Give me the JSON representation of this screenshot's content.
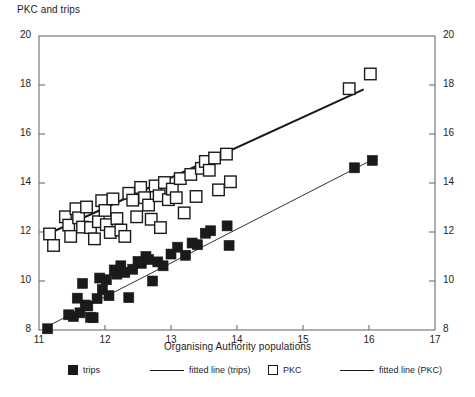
{
  "chart_data": {
    "type": "scatter",
    "title": "PKC and trips",
    "xlabel": "Organising Authority populations",
    "ylabel": "",
    "xlim": [
      11,
      17
    ],
    "ylim": [
      8,
      20
    ],
    "xticks": [
      11,
      12,
      13,
      14,
      15,
      16,
      17
    ],
    "yticks": [
      8,
      10,
      12,
      14,
      16,
      18,
      20
    ],
    "yticks_right": [
      8,
      10,
      12,
      14,
      16,
      18,
      20
    ],
    "grid": false,
    "legend_position": "bottom",
    "series": [
      {
        "name": "trips",
        "marker": "filled-square",
        "color": "#1a1a1a",
        "points": [
          [
            11.13,
            8.05
          ],
          [
            11.45,
            8.62
          ],
          [
            11.52,
            8.55
          ],
          [
            11.58,
            9.3
          ],
          [
            11.62,
            8.7
          ],
          [
            11.66,
            9.9
          ],
          [
            11.7,
            9.02
          ],
          [
            11.74,
            8.98
          ],
          [
            11.78,
            8.52
          ],
          [
            11.82,
            8.5
          ],
          [
            11.88,
            9.28
          ],
          [
            11.92,
            10.12
          ],
          [
            11.96,
            9.65
          ],
          [
            12.02,
            10.05
          ],
          [
            12.06,
            9.4
          ],
          [
            12.14,
            10.45
          ],
          [
            12.18,
            10.28
          ],
          [
            12.24,
            10.62
          ],
          [
            12.3,
            10.35
          ],
          [
            12.36,
            9.32
          ],
          [
            12.42,
            10.48
          ],
          [
            12.5,
            10.8
          ],
          [
            12.55,
            10.72
          ],
          [
            12.62,
            11.0
          ],
          [
            12.66,
            10.88
          ],
          [
            12.72,
            10.0
          ],
          [
            12.8,
            10.78
          ],
          [
            12.88,
            10.62
          ],
          [
            13.0,
            11.1
          ],
          [
            13.1,
            11.38
          ],
          [
            13.22,
            11.05
          ],
          [
            13.32,
            11.55
          ],
          [
            13.4,
            11.48
          ],
          [
            13.52,
            11.95
          ],
          [
            13.6,
            12.05
          ],
          [
            13.85,
            12.25
          ],
          [
            13.88,
            11.45
          ],
          [
            15.78,
            14.62
          ],
          [
            16.05,
            14.92
          ]
        ],
        "fitted_line": {
          "name": "fitted line (trips)",
          "x": [
            11.13,
            16.05
          ],
          "y": [
            8.15,
            14.95
          ],
          "width": 0.9
        }
      },
      {
        "name": "PKC",
        "marker": "open-square",
        "color": "#1a1a1a",
        "points": [
          [
            11.16,
            11.92
          ],
          [
            11.22,
            11.45
          ],
          [
            11.4,
            12.62
          ],
          [
            11.45,
            12.28
          ],
          [
            11.48,
            11.82
          ],
          [
            11.56,
            12.95
          ],
          [
            11.6,
            12.58
          ],
          [
            11.66,
            12.2
          ],
          [
            11.72,
            13.02
          ],
          [
            11.78,
            12.18
          ],
          [
            11.84,
            11.72
          ],
          [
            11.9,
            12.42
          ],
          [
            11.95,
            13.28
          ],
          [
            12.0,
            12.88
          ],
          [
            12.02,
            12.3
          ],
          [
            12.08,
            11.98
          ],
          [
            12.12,
            13.35
          ],
          [
            12.18,
            12.55
          ],
          [
            12.24,
            12.08
          ],
          [
            12.3,
            11.82
          ],
          [
            12.36,
            13.58
          ],
          [
            12.42,
            13.3
          ],
          [
            12.48,
            12.62
          ],
          [
            12.54,
            13.82
          ],
          [
            12.6,
            13.4
          ],
          [
            12.66,
            13.1
          ],
          [
            12.7,
            12.52
          ],
          [
            12.76,
            13.88
          ],
          [
            12.82,
            13.48
          ],
          [
            12.84,
            12.18
          ],
          [
            12.9,
            14.02
          ],
          [
            12.96,
            13.32
          ],
          [
            13.02,
            13.75
          ],
          [
            13.08,
            13.4
          ],
          [
            13.14,
            14.18
          ],
          [
            13.2,
            12.78
          ],
          [
            13.3,
            14.35
          ],
          [
            13.38,
            13.45
          ],
          [
            13.46,
            14.6
          ],
          [
            13.52,
            14.88
          ],
          [
            13.58,
            14.52
          ],
          [
            13.66,
            15.02
          ],
          [
            13.72,
            13.72
          ],
          [
            13.84,
            15.18
          ],
          [
            13.9,
            14.05
          ],
          [
            15.7,
            17.85
          ],
          [
            16.02,
            18.45
          ]
        ],
        "fitted_line": {
          "name": "fitted line (PKC)",
          "x": [
            11.16,
            15.92
          ],
          "y": [
            11.95,
            17.82
          ],
          "width": 2.1
        }
      }
    ]
  },
  "legend": {
    "items": [
      {
        "label": "trips",
        "marker": "filled-square"
      },
      {
        "label": "fitted line (trips)",
        "marker": "line"
      },
      {
        "label": "PKC",
        "marker": "open-square"
      },
      {
        "label": "fitted line (PKC)",
        "marker": "line"
      }
    ]
  },
  "colors": {
    "ink": "#1a1a1a",
    "axis": "#6e6e6e",
    "background": "#ffffff"
  }
}
